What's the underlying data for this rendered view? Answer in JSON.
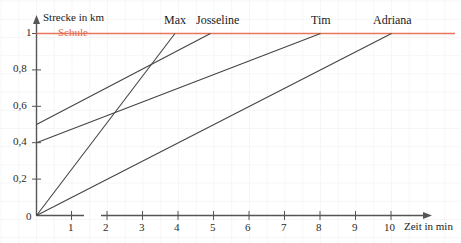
{
  "chart_data": {
    "type": "line",
    "title": "",
    "xlabel": "Zeit in min",
    "ylabel": "Strecke in km",
    "xlim": [
      0,
      10.8
    ],
    "ylim": [
      0,
      1.05
    ],
    "grid": true,
    "legend": "inline-end-labels",
    "x_ticks": [
      "0",
      "1",
      "2",
      "3",
      "4",
      "5",
      "6",
      "7",
      "8",
      "9",
      "10"
    ],
    "x_tick_values": [
      0,
      1,
      2,
      3,
      4,
      5,
      6,
      7,
      8,
      9,
      10
    ],
    "y_ticks": [
      "0",
      "0,2",
      "0,4",
      "0,6",
      "0,8",
      "1"
    ],
    "y_tick_values": [
      0,
      0.2,
      0.4,
      0.6,
      0.8,
      1
    ],
    "reference_line": {
      "label": "Schule",
      "y": 1,
      "color": "#e8755c"
    },
    "line_color": "#444444",
    "series": [
      {
        "name": "Max",
        "label": "Max",
        "start": [
          0,
          0
        ],
        "end": [
          3.9,
          1
        ],
        "slope": 0.256
      },
      {
        "name": "Josseline",
        "label": "Josseline",
        "start": [
          0,
          0.5
        ],
        "end": [
          4.9,
          1
        ],
        "slope": 0.102
      },
      {
        "name": "Tim",
        "label": "Tim",
        "start": [
          0,
          0.4
        ],
        "end": [
          8,
          1
        ],
        "slope": 0.075
      },
      {
        "name": "Adriana",
        "label": "Adriana",
        "start": [
          0,
          0
        ],
        "end": [
          10,
          1
        ],
        "slope": 0.1
      }
    ]
  },
  "labels": {
    "y_axis_title": "Strecke in km",
    "x_axis_title": "Zeit in min",
    "school": "Schule",
    "max": "Max",
    "josseline": "Josseline",
    "tim": "Tim",
    "adriana": "Adriana",
    "y0": "0",
    "y02": "0,2",
    "y04": "0,4",
    "y06": "0,6",
    "y08": "0,8",
    "y1": "1",
    "x0": "0",
    "x1": "1",
    "x2": "2",
    "x3": "3",
    "x4": "4",
    "x5": "5",
    "x6": "6",
    "x7": "7",
    "x8": "8",
    "x9": "9",
    "x10": "10"
  }
}
